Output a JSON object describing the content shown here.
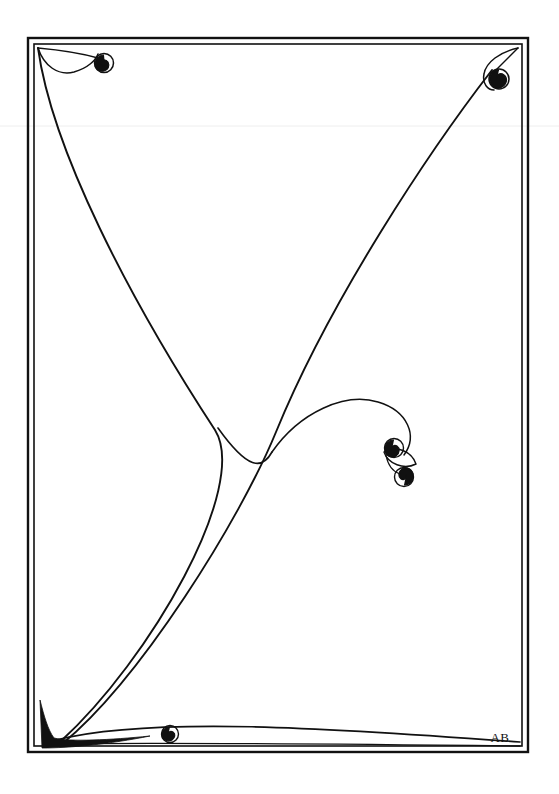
{
  "artwork": {
    "title": "Decorative Border Design",
    "style": "art-nouveau-line-drawing",
    "medium": "pen-and-ink",
    "background_color": "#ffffff",
    "ink_color": "#111111",
    "signature": {
      "monogram": "AB",
      "position": "bottom-right-inside-frame",
      "x": 500,
      "y": 742
    },
    "frame": {
      "type": "double-rule-rectangle",
      "outer": {
        "x": 28,
        "y": 38,
        "width": 500,
        "height": 714
      },
      "inner": {
        "x": 34,
        "y": 44,
        "width": 488,
        "height": 702
      },
      "outer_stroke_width": 2.4,
      "inner_stroke_width": 1.6
    },
    "ornaments": [
      {
        "name": "top-left-spiral",
        "description": "filled comma curl at end of arc from top-left corner",
        "cx": 104,
        "cy": 63,
        "radius": 9
      },
      {
        "name": "top-right-spiral",
        "description": "tight inward coil with filled dot near top-right corner",
        "cx": 499,
        "cy": 79,
        "radius": 10
      },
      {
        "name": "center-upper-spiral",
        "description": "upper spiral of central paired flourish",
        "cx": 394,
        "cy": 448,
        "radius": 9
      },
      {
        "name": "center-lower-spiral",
        "description": "lower mirrored spiral of central paired flourish",
        "cx": 404,
        "cy": 477,
        "radius": 9
      },
      {
        "name": "bottom-spiral",
        "description": "small curl resting on lower sweeping line",
        "cx": 170,
        "cy": 735,
        "radius": 8
      },
      {
        "name": "bottom-left-wedge",
        "description": "solid black tapering wedge in bottom-left corner"
      }
    ],
    "strokes": [
      {
        "name": "left-descending-sweep",
        "from": "top-left-corner",
        "to": "bottom-left-corner"
      },
      {
        "name": "right-descending-sweep",
        "from": "top-right-spiral",
        "to": "bottom-left-corner"
      },
      {
        "name": "central-stem",
        "from": "y-junction",
        "to": "bottom-left-corner"
      },
      {
        "name": "central-flourish-arc",
        "from": "y-junction",
        "to": "center-spirals"
      },
      {
        "name": "bottom-horizontal-sweep",
        "from": "bottom-left-wedge",
        "to": "bottom-right-corner"
      }
    ]
  }
}
